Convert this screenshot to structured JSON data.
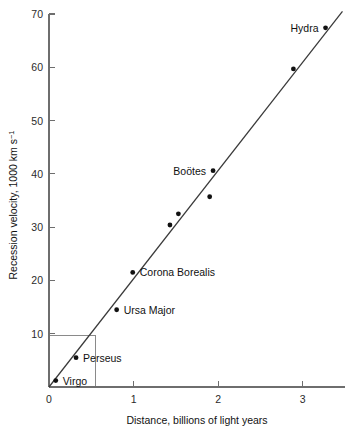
{
  "chart_data": {
    "type": "scatter",
    "title": "",
    "xlabel": "Distance, billions of light years",
    "ylabel": "Recession velocity, 1000 km s",
    "ylabel_exponent": "−1",
    "xlim": [
      0,
      3.5
    ],
    "ylim": [
      0,
      70
    ],
    "xticks": [
      0,
      1,
      2,
      3
    ],
    "xtick_labels": [
      "0",
      "1",
      "2",
      "3"
    ],
    "yticks": [
      10,
      20,
      30,
      40,
      50,
      60,
      70
    ],
    "ytick_labels": [
      "10",
      "20",
      "30",
      "40",
      "50",
      "60",
      "70"
    ],
    "grid": false,
    "legend": "none",
    "points": [
      {
        "label": "Virgo",
        "x": 0.08,
        "y": 1.2,
        "label_side": "right"
      },
      {
        "label": "Perseus",
        "x": 0.32,
        "y": 5.5,
        "label_side": "right"
      },
      {
        "label": "Ursa Major",
        "x": 0.8,
        "y": 14.5,
        "label_side": "right"
      },
      {
        "label": "Corona Borealis",
        "x": 0.99,
        "y": 21.5,
        "label_side": "right"
      },
      {
        "label": "",
        "x": 1.43,
        "y": 30.4,
        "label_side": "none"
      },
      {
        "label": "",
        "x": 1.53,
        "y": 32.5,
        "label_side": "none"
      },
      {
        "label": "Boötes",
        "x": 1.94,
        "y": 40.6,
        "label_side": "left"
      },
      {
        "label": "",
        "x": 1.9,
        "y": 35.7,
        "label_side": "none"
      },
      {
        "label": "",
        "x": 2.89,
        "y": 59.7,
        "label_side": "none"
      },
      {
        "label": "Hydra",
        "x": 3.27,
        "y": 67.4,
        "label_side": "left"
      }
    ],
    "fit_line": {
      "name": "Hubble law best fit",
      "x_start": 0.0,
      "y_start": 0.0,
      "x_end": 3.47,
      "y_end": 70.5
    },
    "construction_lines": {
      "name": "slope construction",
      "x_value": 0.55,
      "y_value": 9.7
    }
  }
}
